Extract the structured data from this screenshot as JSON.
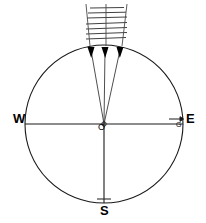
{
  "figure": {
    "type": "physics-wave-diagram",
    "background_color": "#ffffff",
    "stroke_color": "#000000",
    "labels": {
      "west": "W",
      "east": "E",
      "south": "S",
      "center": "O",
      "gradient": "G"
    },
    "geometry": {
      "center_x": 104,
      "center_y": 124,
      "radius": 79,
      "circle_top_y": 45,
      "circle_bottom_y": 203,
      "circle_left_x": 25,
      "circle_right_x": 183
    },
    "rays": [
      {
        "name": "ray-left",
        "from_x": 92,
        "from_y": 48,
        "to_x": 104,
        "to_y": 124
      },
      {
        "name": "ray-center",
        "from_x": 104,
        "from_y": 48,
        "to_x": 104,
        "to_y": 124
      },
      {
        "name": "ray-right",
        "from_x": 119,
        "from_y": 48,
        "to_x": 104,
        "to_y": 124
      }
    ],
    "arrowheads": [
      {
        "name": "arrowhead-left",
        "x": 92,
        "y": 52
      },
      {
        "name": "arrowhead-center",
        "x": 104,
        "y": 52
      },
      {
        "name": "arrowhead-right",
        "x": 119,
        "y": 52
      }
    ],
    "wavefronts": {
      "count": 7,
      "left_x": 86,
      "right_x": 127,
      "top_y": 5,
      "spacing": 5.5
    },
    "ray_guides": [
      {
        "name": "guide-left",
        "x_top": 86,
        "x_bottom": 90
      },
      {
        "name": "guide-center",
        "x_top": 106,
        "x_bottom": 106
      },
      {
        "name": "guide-right",
        "x_top": 127,
        "x_bottom": 122
      }
    ],
    "gradient_marker": {
      "name": "gradient-arrow",
      "x_start": 170,
      "x_end": 180,
      "y": 119
    }
  }
}
